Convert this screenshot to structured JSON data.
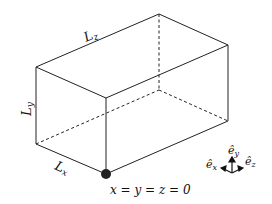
{
  "diagram": {
    "type": "rectangular box (cuboid) domain",
    "labels": {
      "lz": {
        "main": "L",
        "sub": "z"
      },
      "ly": {
        "main": "L",
        "sub": "y"
      },
      "lx": {
        "main": "L",
        "sub": "x"
      },
      "origin": "x = y = z = 0"
    },
    "axes": {
      "ex": {
        "main": "ê",
        "sub": "x"
      },
      "ey": {
        "main": "ê",
        "sub": "y"
      },
      "ez": {
        "main": "ê",
        "sub": "z"
      }
    },
    "colors": {
      "line": "#222222",
      "origin_dot": "#222222",
      "background": "#ffffff"
    }
  }
}
